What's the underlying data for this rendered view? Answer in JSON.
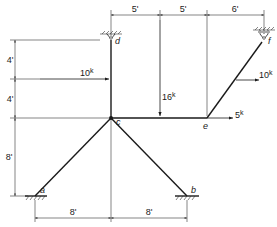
{
  "diagram": {
    "type": "structural frame with supports and loads",
    "joints": {
      "a": {
        "label": "a",
        "x": 35,
        "y": 196,
        "support": "fixed"
      },
      "b": {
        "label": "b",
        "x": 187,
        "y": 196,
        "support": "fixed"
      },
      "c": {
        "label": "c",
        "x": 111,
        "y": 118,
        "support": "none"
      },
      "d": {
        "label": "d",
        "x": 111,
        "y": 38,
        "support": "pin"
      },
      "e": {
        "label": "e",
        "x": 207,
        "y": 118,
        "support": "none"
      },
      "f": {
        "label": "f",
        "x": 264,
        "y": 38,
        "support": "roller"
      }
    },
    "members": [
      [
        "a",
        "c"
      ],
      [
        "b",
        "c"
      ],
      [
        "c",
        "d"
      ],
      [
        "c",
        "e"
      ],
      [
        "e",
        "f"
      ]
    ],
    "loads": [
      {
        "id": "load-10k-left",
        "label": "10",
        "unit": "k",
        "direction": "right"
      },
      {
        "id": "load-16k",
        "label": "16",
        "unit": "k",
        "direction": "down"
      },
      {
        "id": "load-5k",
        "label": "5",
        "unit": "k",
        "direction": "right"
      },
      {
        "id": "load-10k-right",
        "label": "10",
        "unit": "k",
        "direction": "right"
      }
    ],
    "dimensions": {
      "top": [
        "5'",
        "5'",
        "6'"
      ],
      "left": [
        "4'",
        "4'",
        "8'"
      ],
      "bottom": [
        "8'",
        "8'"
      ]
    }
  }
}
